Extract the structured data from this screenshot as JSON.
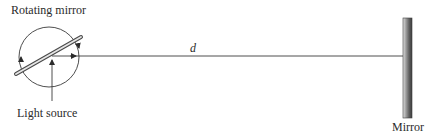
{
  "diagram": {
    "labels": {
      "rotating_mirror": "Rotating mirror",
      "light_source": "Light source",
      "distance": "d",
      "mirror": "Mirror"
    },
    "colors": {
      "line": "#3a3a3a",
      "mirror_dark": "#5a5a5a",
      "mirror_light": "#d0d0d0",
      "text": "#2b2b2b"
    },
    "geometry": {
      "circle_center": [
        49,
        57
      ],
      "circle_radius": 30,
      "beam_y": 56,
      "fixed_mirror_x": [
        403,
        412
      ],
      "fixed_mirror_y": [
        18,
        118
      ]
    }
  }
}
